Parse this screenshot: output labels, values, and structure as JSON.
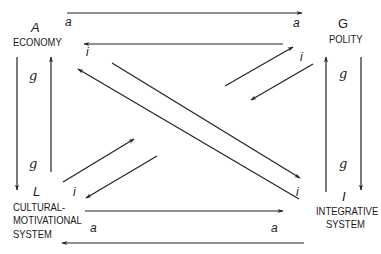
{
  "diagram": {
    "type": "AGIL four-function interchange diagram",
    "nodes": {
      "A": {
        "letter": "A",
        "name": "ECONOMY"
      },
      "G": {
        "letter": "G",
        "name": "POLITY"
      },
      "L": {
        "letter": "L",
        "name_line1": "CULTURAL-",
        "name_line2": "MOTIVATIONAL",
        "name_line3": "SYSTEM"
      },
      "I": {
        "letter": "I",
        "name_line1": "INTEGRATIVE",
        "name_line2": "SYSTEM"
      }
    },
    "edge_labels": {
      "top_left_a": "a",
      "top_right_a": "a",
      "economy_i": "i",
      "polity_i": "i",
      "left_top_g": "g",
      "left_bottom_g": "g",
      "right_top_g": "g",
      "right_bottom_g": "g",
      "cultural_i": "i",
      "integrative_i": "i",
      "bottom_left_a": "a",
      "bottom_right_a": "a"
    },
    "edges": [
      {
        "from": "A",
        "to": "G",
        "label": "a"
      },
      {
        "from": "G",
        "to": "A",
        "label": "i"
      },
      {
        "from": "A",
        "to": "L",
        "label": "g"
      },
      {
        "from": "L",
        "to": "A",
        "label": "g"
      },
      {
        "from": "I",
        "to": "G",
        "label": "g"
      },
      {
        "from": "G",
        "to": "I",
        "label": "g"
      },
      {
        "from": "L",
        "to": "I",
        "label": "a"
      },
      {
        "from": "I",
        "to": "L",
        "label": "a"
      },
      {
        "from": "A",
        "to": "I",
        "label": "i"
      },
      {
        "from": "I",
        "to": "A",
        "label": "i"
      },
      {
        "from": "L",
        "to": "G",
        "label": "i"
      },
      {
        "from": "G",
        "to": "L",
        "label": "i"
      }
    ],
    "stroke_color": "#222222",
    "background_color": "#ffffff"
  }
}
